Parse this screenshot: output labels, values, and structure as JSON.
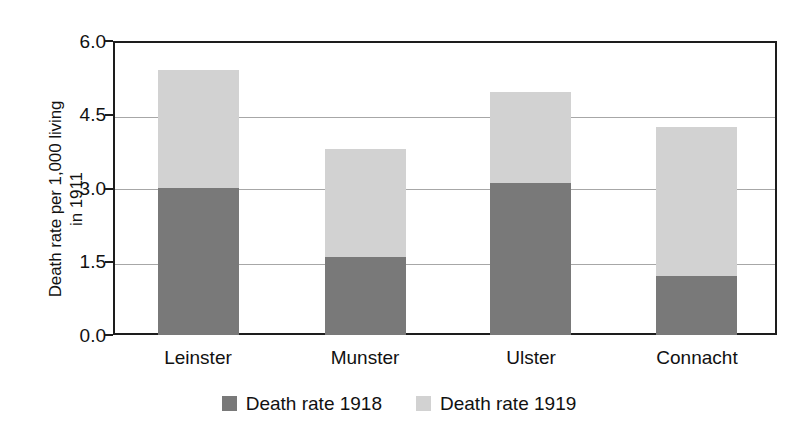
{
  "chart_data": {
    "type": "bar",
    "subtype": "stacked-vertical",
    "title": "",
    "xlabel": "",
    "ylabel": "Death rate per 1,000 living\nin 1911",
    "ylabel_lines": [
      "Death rate per 1,000 living",
      "in 1911"
    ],
    "categories": [
      "Leinster",
      "Munster",
      "Ulster",
      "Connacht"
    ],
    "series": [
      {
        "name": "Death rate 1918",
        "color": "#797979",
        "values": [
          3.0,
          1.6,
          3.1,
          1.2
        ]
      },
      {
        "name": "Death rate 1919",
        "color": "#d2d2d2",
        "values": [
          2.4,
          2.2,
          1.85,
          3.05
        ]
      }
    ],
    "totals": [
      5.4,
      3.8,
      4.95,
      4.25
    ],
    "ylim": [
      0.0,
      6.0
    ],
    "ytick_labels": [
      "0.0",
      "1.5",
      "3.0",
      "4.5",
      "6.0"
    ],
    "ytick_values": [
      0.0,
      1.5,
      3.0,
      4.5,
      6.0
    ],
    "grid": true,
    "grid_axis": "y",
    "legend_position": "bottom-center",
    "frame_color": "#1d1d1d",
    "grid_color": "#a7a7a7",
    "background": "#ffffff"
  },
  "legend": {
    "items": [
      {
        "label": "Death rate 1918",
        "color": "#797979"
      },
      {
        "label": "Death rate 1919",
        "color": "#d2d2d2"
      }
    ]
  }
}
